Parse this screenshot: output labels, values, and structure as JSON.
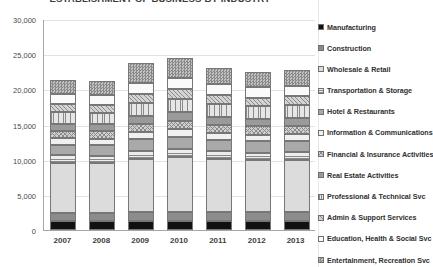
{
  "chart_data": {
    "type": "bar",
    "stacked": true,
    "title": "ESTABLISHMENT OF BUSINESS BY INDUSTRY",
    "xlabel": "",
    "ylabel": "",
    "ylim": [
      0,
      30000
    ],
    "ytick_labels": [
      "30,000",
      "25,000",
      "20,000",
      "15,000",
      "10,000",
      "5,000",
      "0"
    ],
    "ytick_values": [
      30000,
      25000,
      20000,
      15000,
      10000,
      5000,
      0
    ],
    "grid": true,
    "legend_position": "right",
    "categories": [
      "2007",
      "2008",
      "2009",
      "2010",
      "2011",
      "2012",
      "2013"
    ],
    "totals": [
      21300,
      21200,
      23700,
      24500,
      23000,
      22500,
      22800
    ],
    "series": [
      {
        "name": "Manufacturing",
        "pattern": "solid-black",
        "color": "#111111",
        "values": [
          1250,
          1230,
          1300,
          1320,
          1300,
          1280,
          1270
        ]
      },
      {
        "name": "Construction",
        "pattern": "dark-gray",
        "color": "#8c8c8c",
        "values": [
          1150,
          1130,
          1250,
          1300,
          1280,
          1240,
          1260
        ]
      },
      {
        "name": "Wholesale & Retail",
        "pattern": "light-solid",
        "color": "#dcdcdc",
        "values": [
          7200,
          7150,
          7600,
          7750,
          7500,
          7400,
          7450
        ]
      },
      {
        "name": "Transportation  & Storage",
        "pattern": "h-lines",
        "color": "#ededed",
        "values": [
          1050,
          1040,
          1150,
          1200,
          1120,
          1100,
          1110
        ]
      },
      {
        "name": "Hotel & Restaurants",
        "pattern": "mid-gray",
        "color": "#a9a9a9",
        "values": [
          1500,
          1490,
          1620,
          1680,
          1600,
          1570,
          1590
        ]
      },
      {
        "name": "Information & Communications",
        "pattern": "fine-dots",
        "color": "#f0f0f0",
        "values": [
          900,
          910,
          1000,
          1050,
          1000,
          980,
          990
        ]
      },
      {
        "name": "Financial & Insurance Activities",
        "pattern": "cross-hatch",
        "color": "#cfcfcf",
        "values": [
          1100,
          1090,
          1200,
          1250,
          1180,
          1160,
          1170
        ]
      },
      {
        "name": "Real Estate Activities",
        "pattern": "dense-gray",
        "color": "#9a9a9a",
        "values": [
          1000,
          995,
          1120,
          1180,
          1100,
          1080,
          1090
        ]
      },
      {
        "name": "Professional & Technical Svc",
        "pattern": "v-lines",
        "color": "#e6e6e6",
        "values": [
          1600,
          1620,
          1800,
          1900,
          1800,
          1760,
          1790
        ]
      },
      {
        "name": "Admin & Support Services",
        "pattern": "diag-hatch",
        "color": "#d4d4d4",
        "values": [
          1150,
          1160,
          1300,
          1380,
          1300,
          1270,
          1290
        ]
      },
      {
        "name": "Education, Health & Social Svc",
        "pattern": "open-white",
        "color": "#fafafa",
        "values": [
          1400,
          1390,
          1560,
          1640,
          1560,
          1530,
          1550
        ]
      },
      {
        "name": "Entertainment, Recreation Svc",
        "pattern": "checker",
        "color": "#c2c2c2",
        "values": [
          2000,
          1995,
          2800,
          2850,
          2260,
          2130,
          2240
        ]
      }
    ]
  }
}
